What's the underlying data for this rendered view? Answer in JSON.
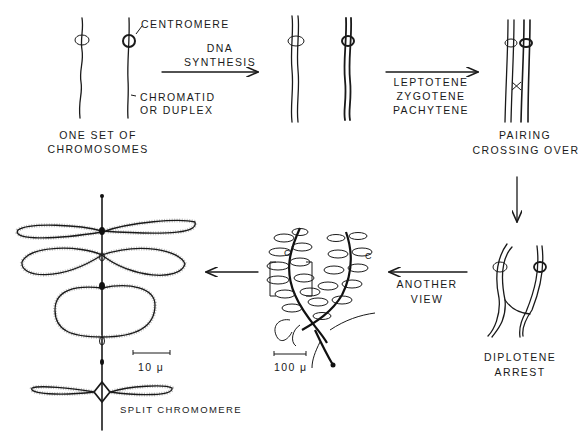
{
  "diagram": {
    "stages": {
      "one_set": {
        "label_line1": "ONE SET OF",
        "label_line2": "CHROMOSOMES"
      },
      "centromere_callout": "CENTROMERE",
      "chromatid_callout_line1": "CHROMATID",
      "chromatid_callout_line2": "OR DUPLEX",
      "dna_synthesis": {
        "line1": "DNA",
        "line2": "SYNTHESIS"
      },
      "prophase": {
        "line1": "LEPTOTENE",
        "line2": "ZYGOTENE",
        "line3": "PACHYTENE"
      },
      "pairing": {
        "line1": "PAIRING",
        "line2": "CROSSING OVER"
      },
      "diplotene": {
        "line1": "DIPLOTENE",
        "line2": "ARREST"
      },
      "another_view": {
        "line1": "ANOTHER",
        "line2": "VIEW"
      },
      "lampbrush": {
        "loop_label_left": "C",
        "loop_label_right": "C",
        "scale": "100 μ"
      },
      "loops_detail": {
        "scale": "10 μ",
        "split_label": "SPLIT CHROMOMERE"
      }
    },
    "arrows": [
      {
        "from": "one_set",
        "to": "dna_synthesized",
        "direction": "right"
      },
      {
        "from": "dna_synthesized",
        "to": "pairing",
        "direction": "right"
      },
      {
        "from": "pairing",
        "to": "diplotene",
        "direction": "down"
      },
      {
        "from": "diplotene",
        "to": "lampbrush",
        "direction": "left"
      },
      {
        "from": "lampbrush",
        "to": "loops_detail",
        "direction": "left"
      }
    ]
  }
}
